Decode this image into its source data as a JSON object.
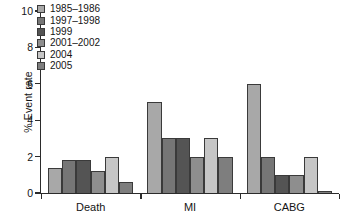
{
  "chart_data": {
    "type": "bar",
    "title": "",
    "subtitle": "",
    "xlabel": "",
    "ylabel": "% Event rate",
    "categories": [
      "Death",
      "MI",
      "CABG"
    ],
    "ylim": [
      0,
      10
    ],
    "yticks": [
      0,
      2,
      4,
      6,
      8,
      10
    ],
    "ytick_labels": [
      "0",
      "2",
      "4",
      "6",
      "8",
      "10"
    ],
    "grid": false,
    "legend_position": "upper left",
    "series": [
      {
        "name": "1985–1986",
        "color": "#a8a8a8",
        "values": [
          1.4,
          5.0,
          6.0
        ]
      },
      {
        "name": "1997–1998",
        "color": "#767676",
        "values": [
          1.8,
          3.0,
          2.0
        ]
      },
      {
        "name": "1999",
        "color": "#545454",
        "values": [
          1.8,
          3.0,
          1.0
        ]
      },
      {
        "name": "2001–2002",
        "color": "#8e8e8e",
        "values": [
          1.2,
          2.0,
          1.0
        ]
      },
      {
        "name": "2004",
        "color": "#c6c6c6",
        "values": [
          2.0,
          3.0,
          2.0
        ]
      },
      {
        "name": "2005",
        "color": "#7e7e7e",
        "values": [
          0.6,
          2.0,
          0.1
        ]
      }
    ]
  },
  "axis": {
    "y_label": "% Event rate"
  }
}
